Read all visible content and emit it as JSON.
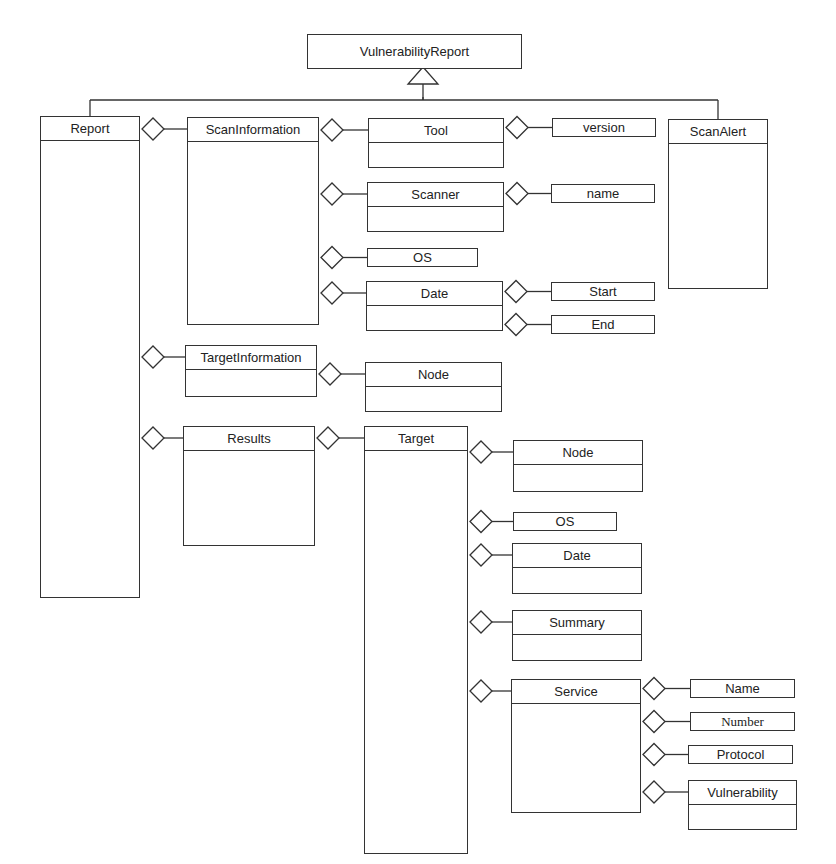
{
  "diagram": {
    "type": "UML class diagram",
    "root": {
      "id": "vulnerability_report",
      "label": "VulnerabilityReport"
    },
    "classes": [
      {
        "id": "report",
        "label": "Report",
        "x": 40,
        "y": 116,
        "w": 100,
        "h": 482
      },
      {
        "id": "scan_information",
        "label": "ScanInformation",
        "x": 187,
        "y": 117,
        "w": 132,
        "h": 208
      },
      {
        "id": "target_information",
        "label": "TargetInformation",
        "x": 185,
        "y": 345,
        "w": 132,
        "h": 52
      },
      {
        "id": "results",
        "label": "Results",
        "x": 183,
        "y": 426,
        "w": 132,
        "h": 120
      },
      {
        "id": "tool",
        "label": "Tool",
        "x": 368,
        "y": 118,
        "w": 136,
        "h": 50
      },
      {
        "id": "scanner",
        "label": "Scanner",
        "x": 367,
        "y": 182,
        "w": 137,
        "h": 50
      },
      {
        "id": "os_scan",
        "label": "OS",
        "x": 367,
        "y": 248,
        "w": 111,
        "h": 19,
        "single": true
      },
      {
        "id": "date_scan",
        "label": "Date",
        "x": 366,
        "y": 281,
        "w": 137,
        "h": 50
      },
      {
        "id": "node_ti",
        "label": "Node",
        "x": 365,
        "y": 362,
        "w": 137,
        "h": 50
      },
      {
        "id": "version",
        "label": "version",
        "x": 552,
        "y": 118,
        "w": 104,
        "h": 19,
        "single": true
      },
      {
        "id": "name",
        "label": "name",
        "x": 551,
        "y": 184,
        "w": 104,
        "h": 19,
        "single": true
      },
      {
        "id": "start",
        "label": "Start",
        "x": 551,
        "y": 282,
        "w": 104,
        "h": 19,
        "single": true
      },
      {
        "id": "end",
        "label": "End",
        "x": 551,
        "y": 315,
        "w": 104,
        "h": 19,
        "single": true
      },
      {
        "id": "scan_alert",
        "label": "ScanAlert",
        "x": 668,
        "y": 119,
        "w": 100,
        "h": 170
      },
      {
        "id": "target",
        "label": "Target",
        "x": 364,
        "y": 426,
        "w": 104,
        "h": 428
      },
      {
        "id": "node_t",
        "label": "Node",
        "x": 513,
        "y": 440,
        "w": 130,
        "h": 52
      },
      {
        "id": "os_t",
        "label": "OS",
        "x": 513,
        "y": 512,
        "w": 104,
        "h": 19,
        "single": true
      },
      {
        "id": "date_t",
        "label": "Date",
        "x": 512,
        "y": 543,
        "w": 130,
        "h": 51
      },
      {
        "id": "summary",
        "label": "Summary",
        "x": 512,
        "y": 610,
        "w": 130,
        "h": 51
      },
      {
        "id": "service",
        "label": "Service",
        "x": 511,
        "y": 679,
        "w": 130,
        "h": 134
      },
      {
        "id": "svc_name",
        "label": "Name",
        "x": 690,
        "y": 679,
        "w": 105,
        "h": 19,
        "single": true
      },
      {
        "id": "svc_number",
        "label": "Number",
        "x": 690,
        "y": 712,
        "w": 105,
        "h": 19,
        "single": true,
        "serif": true
      },
      {
        "id": "svc_protocol",
        "label": "Protocol",
        "x": 688,
        "y": 745,
        "w": 105,
        "h": 19,
        "single": true
      },
      {
        "id": "svc_vulnerability",
        "label": "Vulnerability",
        "x": 688,
        "y": 780,
        "w": 109,
        "h": 50
      }
    ],
    "aggregations": [
      {
        "from": "report",
        "to": "scan_information"
      },
      {
        "from": "report",
        "to": "target_information"
      },
      {
        "from": "report",
        "to": "results"
      },
      {
        "from": "scan_information",
        "to": "tool"
      },
      {
        "from": "scan_information",
        "to": "scanner"
      },
      {
        "from": "scan_information",
        "to": "os_scan"
      },
      {
        "from": "scan_information",
        "to": "date_scan"
      },
      {
        "from": "tool",
        "to": "version"
      },
      {
        "from": "scanner",
        "to": "name"
      },
      {
        "from": "date_scan",
        "to": "start"
      },
      {
        "from": "date_scan",
        "to": "end"
      },
      {
        "from": "target_information",
        "to": "node_ti"
      },
      {
        "from": "results",
        "to": "target"
      },
      {
        "from": "target",
        "to": "node_t"
      },
      {
        "from": "target",
        "to": "os_t"
      },
      {
        "from": "target",
        "to": "date_t"
      },
      {
        "from": "target",
        "to": "summary"
      },
      {
        "from": "target",
        "to": "service"
      },
      {
        "from": "service",
        "to": "svc_name"
      },
      {
        "from": "service",
        "to": "svc_number"
      },
      {
        "from": "service",
        "to": "svc_protocol"
      },
      {
        "from": "service",
        "to": "svc_vulnerability"
      }
    ],
    "generalizations": [
      {
        "parent": "vulnerability_report",
        "children": [
          "report",
          "scan_alert"
        ]
      }
    ]
  }
}
